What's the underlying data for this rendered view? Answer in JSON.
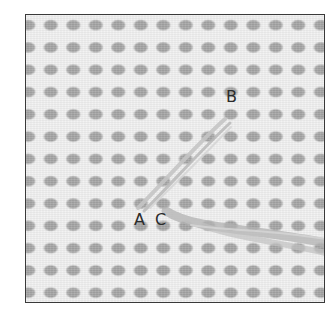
{
  "figure": {
    "title": "",
    "labels": [
      {
        "id": "A",
        "text": "A",
        "x": 134,
        "y": 212
      },
      {
        "id": "B",
        "text": "B",
        "x": 226,
        "y": 89
      },
      {
        "id": "C",
        "text": "C",
        "x": 155,
        "y": 212
      }
    ],
    "colors": {
      "mesh_thread": "#f1f1f1",
      "mesh_hole": "#a6a6a6",
      "stitch_thread": "#bdbdbd",
      "frame_border": "#3a3a3a",
      "label_text": "#2b2b2b"
    },
    "grid": {
      "columns": 14,
      "rows": 13,
      "pitch_px": 22.5
    }
  }
}
